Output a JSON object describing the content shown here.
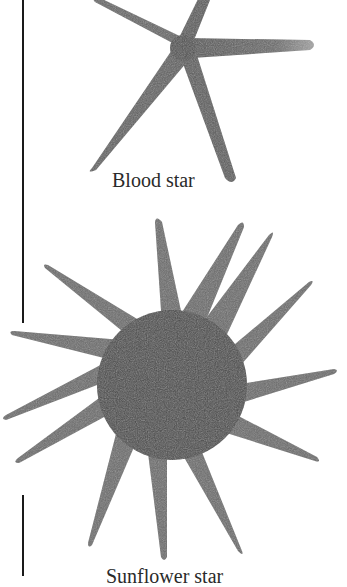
{
  "figures": [
    {
      "caption": "Blood star",
      "arms": 5
    },
    {
      "caption": "Sunflower star",
      "arms": 14
    }
  ],
  "colors": {
    "body_dark": "#4a4a4a",
    "body_mid": "#6e6e6e",
    "tip_light": "#9a9a9a",
    "rule": "#1a1a1a"
  }
}
